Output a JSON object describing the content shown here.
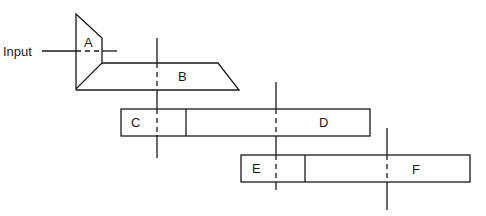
{
  "diagram": {
    "input_label": "Input",
    "components": [
      {
        "id": "A",
        "label": "A",
        "shape": "trapezoid-input"
      },
      {
        "id": "B",
        "label": "B",
        "shape": "parallelogram"
      },
      {
        "id": "C",
        "label": "C",
        "shape": "box"
      },
      {
        "id": "D",
        "label": "D",
        "shape": "box"
      },
      {
        "id": "E",
        "label": "E",
        "shape": "box"
      },
      {
        "id": "F",
        "label": "F",
        "shape": "box"
      }
    ],
    "stroke_color": "#1a1a1a",
    "background": "#ffffff"
  }
}
